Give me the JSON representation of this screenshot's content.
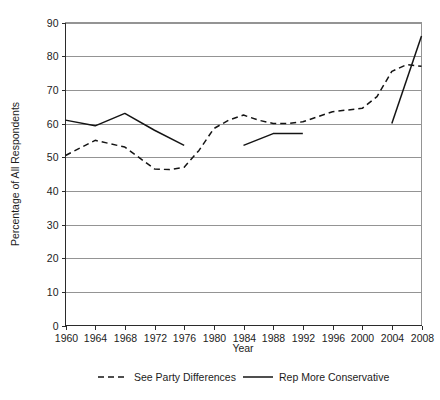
{
  "chart_data": {
    "type": "line",
    "title": "",
    "xlabel": "Year",
    "ylabel": "Percentage of All Respondents",
    "xlim": [
      1960,
      2008
    ],
    "ylim": [
      0,
      90
    ],
    "ytick_step": 10,
    "xtick_step": 4,
    "grid": "horizontal",
    "legend_position": "bottom",
    "y_ticks": [
      "0",
      "10",
      "20",
      "30",
      "40",
      "50",
      "60",
      "70",
      "80",
      "90"
    ],
    "x_ticks": [
      "1960",
      "1964",
      "1968",
      "1972",
      "1976",
      "1980",
      "1984",
      "1988",
      "1992",
      "1996",
      "2000",
      "2004",
      "2008"
    ],
    "series": [
      {
        "name": "See Party Differences",
        "style": "dashed",
        "color": "#141414",
        "x": [
          1960,
          1964,
          1968,
          1972,
          1974,
          1976,
          1978,
          1980,
          1982,
          1984,
          1986,
          1988,
          1990,
          1992,
          1994,
          1996,
          1998,
          2000,
          2002,
          2004,
          2006,
          2008
        ],
        "values": [
          50.5,
          55.0,
          53.0,
          46.5,
          46.3,
          47.0,
          52.0,
          58.5,
          61.0,
          62.5,
          61.0,
          60.0,
          60.0,
          60.5,
          62.0,
          63.5,
          64.0,
          64.5,
          68.0,
          75.5,
          77.5,
          77.0
        ]
      },
      {
        "name": "Rep More Conservative",
        "style": "solid",
        "color": "#141414",
        "segments": [
          {
            "x": [
              1960,
              1964,
              1968,
              1972,
              1976
            ],
            "values": [
              61.0,
              59.3,
              63.0,
              58.0,
              53.5
            ]
          },
          {
            "x": [
              1984,
              1988,
              1992
            ],
            "values": [
              53.5,
              57.0,
              57.0
            ]
          },
          {
            "x": [
              2004,
              2008
            ],
            "values": [
              60.0,
              86.0
            ]
          }
        ]
      }
    ]
  },
  "legend": {
    "items": [
      {
        "label": "See Party Differences",
        "style": "dashed"
      },
      {
        "label": "Rep More Conservative",
        "style": "solid"
      }
    ]
  },
  "axes": {
    "x_title": "Year",
    "y_title": "Percentage of All Respondents"
  }
}
